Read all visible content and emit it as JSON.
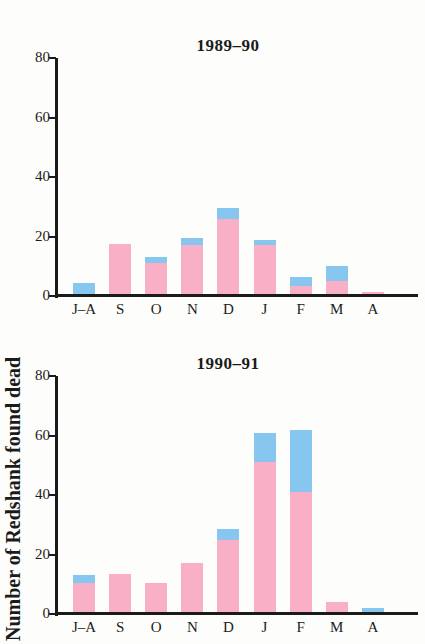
{
  "figure": {
    "ylabel": "Number of Redshank found dead",
    "background": "#fdfdfc",
    "axis_color": "#1b1b1b",
    "text_color": "#1b1b1b"
  },
  "chart_data": [
    {
      "type": "bar",
      "stacked": true,
      "title": "1989–90",
      "categories": [
        "J–A",
        "S",
        "O",
        "N",
        "D",
        "J",
        "F",
        "M",
        "A"
      ],
      "series": [
        {
          "name": "pink",
          "color": "#F9B0C6",
          "values": [
            0,
            17.5,
            11,
            17,
            26,
            17,
            3.5,
            5,
            1.5
          ]
        },
        {
          "name": "blue",
          "color": "#87C7EF",
          "values": [
            4.5,
            0,
            2,
            2.5,
            3.5,
            2,
            3,
            5,
            0
          ]
        }
      ],
      "totals": [
        4.5,
        17.5,
        13,
        19.5,
        29.5,
        19,
        6.5,
        10,
        1.5
      ],
      "xlabel": "",
      "ylabel": "",
      "ylim": [
        0,
        80
      ],
      "yticks": [
        80,
        60,
        40,
        20,
        0
      ],
      "grid": false,
      "legend": false
    },
    {
      "type": "bar",
      "stacked": true,
      "title": "1990–91",
      "categories": [
        "J–A",
        "S",
        "O",
        "N",
        "D",
        "J",
        "F",
        "M",
        "A"
      ],
      "series": [
        {
          "name": "pink",
          "color": "#F9B0C6",
          "values": [
            10.5,
            13.5,
            10.5,
            17,
            25,
            51,
            41,
            4,
            0
          ]
        },
        {
          "name": "blue",
          "color": "#87C7EF",
          "values": [
            2.5,
            0,
            0,
            0,
            3.5,
            10,
            21,
            0,
            2
          ]
        }
      ],
      "totals": [
        13,
        13.5,
        10.5,
        17,
        28.5,
        61,
        62,
        4,
        2
      ],
      "xlabel": "",
      "ylabel": "",
      "ylim": [
        0,
        80
      ],
      "yticks": [
        80,
        60,
        40,
        20,
        0
      ],
      "grid": false,
      "legend": false
    }
  ]
}
